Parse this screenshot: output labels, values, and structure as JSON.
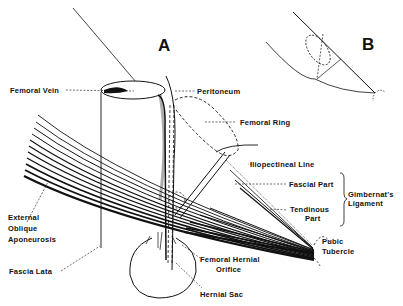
{
  "panels": {
    "a": "A",
    "b": "B"
  },
  "labels": {
    "femoral_vein": "Femoral Vein",
    "peritoneum": "Peritoneum",
    "femoral_ring": "Femoral Ring",
    "iliopectineal_line": "Iliopectineal Line",
    "fascial_part": "Fascial Part",
    "gimbernat_1": "Gimbernat's",
    "gimbernat_2": "Ligament",
    "tendinous_1": "Tendinous",
    "tendinous_2": "Part",
    "pubic_1": "Pubic",
    "pubic_2": "Tubercle",
    "external_1": "External",
    "external_2": "Oblique",
    "external_3": "Aponeurosis",
    "fascia_lata": "Fascia Lata",
    "orifice_1": "Femoral Hernial",
    "orifice_2": "Orifice",
    "hernial_sac": "Hernial Sac"
  },
  "colors": {
    "ink": "#111111",
    "background": "#ffffff"
  }
}
